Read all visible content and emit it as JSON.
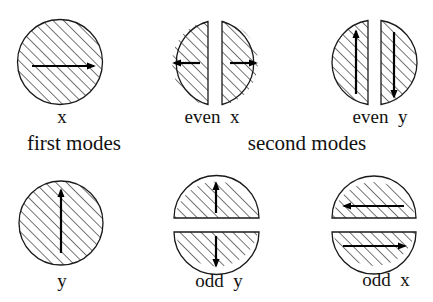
{
  "diagram": {
    "type": "waveguide-mode-patterns",
    "colors": {
      "stroke": "#1a1a1a",
      "hatch": "#1a1a1a",
      "arrow": "#000000",
      "background": "#ffffff"
    },
    "groups": [
      {
        "id": "first",
        "label": "first modes"
      },
      {
        "id": "second",
        "label": "second modes"
      }
    ],
    "modes": [
      {
        "id": "x",
        "label": "x",
        "shape": "full-circle",
        "arrows": [
          "right"
        ]
      },
      {
        "id": "even_x",
        "label": "even  x",
        "shape": "split-vertical",
        "arrows": [
          "left",
          "right"
        ]
      },
      {
        "id": "even_y",
        "label": "even  y",
        "shape": "split-vertical",
        "arrows": [
          "up",
          "down"
        ]
      },
      {
        "id": "y",
        "label": "y",
        "shape": "full-circle",
        "arrows": [
          "up"
        ]
      },
      {
        "id": "odd_y",
        "label": "odd  y",
        "shape": "split-horizontal",
        "arrows": [
          "up",
          "down"
        ]
      },
      {
        "id": "odd_x",
        "label": "odd  x",
        "shape": "split-horizontal",
        "arrows": [
          "left",
          "right"
        ]
      }
    ]
  }
}
